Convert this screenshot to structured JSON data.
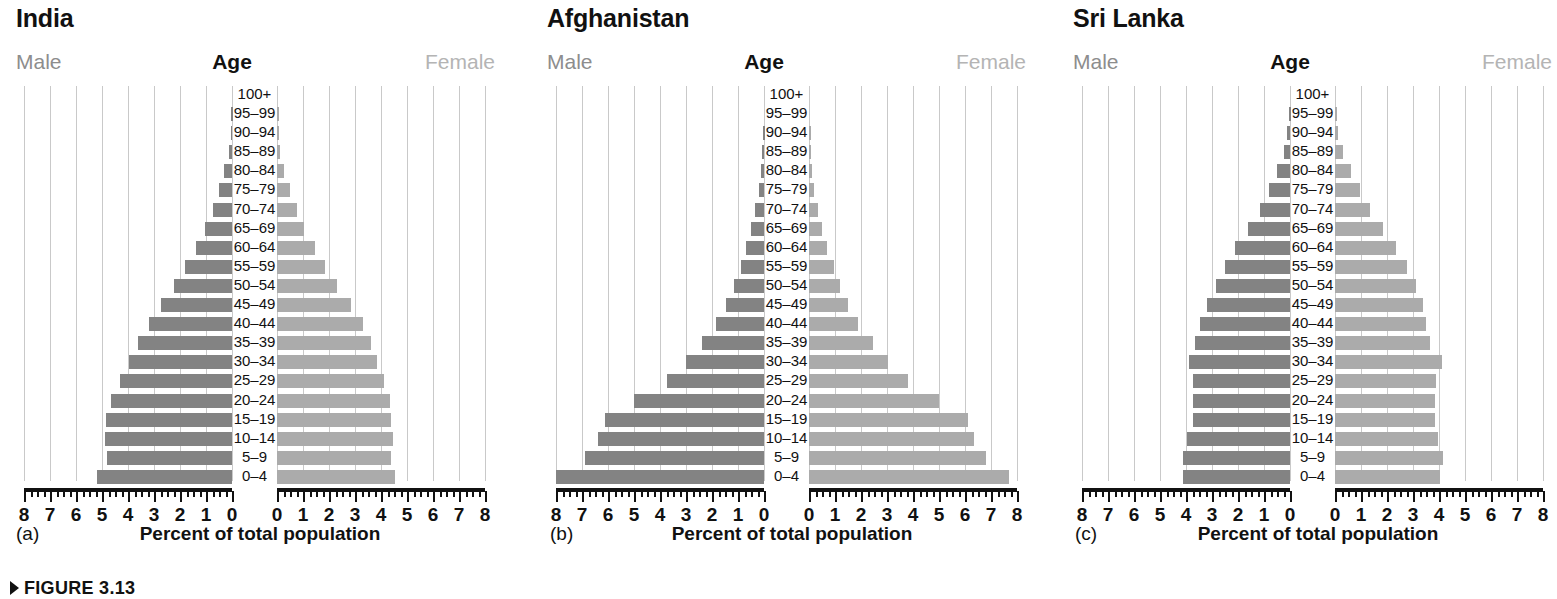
{
  "figure": {
    "caption": "FIGURE 3.13",
    "axis_caption": "Percent of total population",
    "male_label": "Male",
    "female_label": "Female",
    "age_label": "Age",
    "age_groups": [
      "100+",
      "95–99",
      "90–94",
      "85–89",
      "80–84",
      "75–79",
      "70–74",
      "65–69",
      "60–64",
      "55–59",
      "50–54",
      "45–49",
      "40–44",
      "35–39",
      "30–34",
      "25–29",
      "20–24",
      "15–19",
      "10–14",
      "5–9",
      "0–4"
    ],
    "tick_labels_left": [
      "8",
      "7",
      "6",
      "5",
      "4",
      "3",
      "2",
      "1",
      "0"
    ],
    "tick_labels_right": [
      "0",
      "1",
      "2",
      "3",
      "4",
      "5",
      "6",
      "7",
      "8"
    ],
    "colors": {
      "male_bar": "#838383",
      "female_bar": "#ababab",
      "gridline": "#c9c9c9",
      "axis": "#111111",
      "male_header_text": "#8d8d8d",
      "female_header_text": "#b4b4b4"
    }
  },
  "chart_data": [
    {
      "type": "bar",
      "title": "India",
      "panel_letter": "(a)",
      "xlabel": "Percent of total population",
      "ylabel": "Age",
      "xlim": [
        0,
        8
      ],
      "grid": true,
      "legend_position": "top-left-right",
      "categories": [
        "100+",
        "95–99",
        "90–94",
        "85–89",
        "80–84",
        "75–79",
        "70–74",
        "65–69",
        "60–64",
        "55–59",
        "50–54",
        "45–49",
        "40–44",
        "35–39",
        "30–34",
        "25–29",
        "20–24",
        "15–19",
        "10–14",
        "5–9",
        "0–4"
      ],
      "series": [
        {
          "name": "Male",
          "values": [
            0.0,
            0.02,
            0.05,
            0.12,
            0.3,
            0.5,
            0.75,
            1.05,
            1.4,
            1.8,
            2.25,
            2.75,
            3.2,
            3.6,
            3.95,
            4.3,
            4.65,
            4.85,
            4.9,
            4.8,
            5.2
          ]
        },
        {
          "name": "Female",
          "values": [
            0.0,
            0.02,
            0.05,
            0.12,
            0.28,
            0.5,
            0.75,
            1.05,
            1.45,
            1.85,
            2.3,
            2.85,
            3.3,
            3.6,
            3.85,
            4.1,
            4.35,
            4.4,
            4.45,
            4.4,
            4.55
          ]
        }
      ]
    },
    {
      "type": "bar",
      "title": "Afghanistan",
      "panel_letter": "(b)",
      "xlabel": "Percent of total population",
      "ylabel": "Age",
      "xlim": [
        0,
        8
      ],
      "grid": true,
      "legend_position": "top-left-right",
      "categories": [
        "100+",
        "95–99",
        "90–94",
        "85–89",
        "80–84",
        "75–79",
        "70–74",
        "65–69",
        "60–64",
        "55–59",
        "50–54",
        "45–49",
        "40–44",
        "35–39",
        "30–34",
        "25–29",
        "20–24",
        "15–19",
        "10–14",
        "5–9",
        "0–4"
      ],
      "series": [
        {
          "name": "Male",
          "values": [
            0.0,
            0.0,
            0.02,
            0.06,
            0.1,
            0.2,
            0.35,
            0.5,
            0.7,
            0.9,
            1.15,
            1.45,
            1.85,
            2.4,
            3.0,
            3.75,
            5.0,
            6.1,
            6.4,
            6.9,
            8.0
          ]
        },
        {
          "name": "Female",
          "values": [
            0.0,
            0.0,
            0.02,
            0.06,
            0.1,
            0.2,
            0.35,
            0.5,
            0.7,
            0.95,
            1.2,
            1.5,
            1.9,
            2.45,
            3.05,
            3.8,
            5.0,
            6.1,
            6.35,
            6.8,
            7.7
          ]
        }
      ]
    },
    {
      "type": "bar",
      "title": "Sri Lanka",
      "panel_letter": "(c)",
      "xlabel": "Percent of total population",
      "ylabel": "Age",
      "xlim": [
        0,
        8
      ],
      "grid": true,
      "legend_position": "top-left-right",
      "categories": [
        "100+",
        "95–99",
        "90–94",
        "85–89",
        "80–84",
        "75–79",
        "70–74",
        "65–69",
        "60–64",
        "55–59",
        "50–54",
        "45–49",
        "40–44",
        "35–39",
        "30–34",
        "25–29",
        "20–24",
        "15–19",
        "10–14",
        "5–9",
        "0–4"
      ],
      "series": [
        {
          "name": "Male",
          "values": [
            0.0,
            0.03,
            0.1,
            0.25,
            0.5,
            0.8,
            1.15,
            1.6,
            2.1,
            2.5,
            2.85,
            3.2,
            3.45,
            3.65,
            3.9,
            3.75,
            3.75,
            3.75,
            3.95,
            4.1,
            4.1
          ]
        },
        {
          "name": "Female",
          "values": [
            0.0,
            0.03,
            0.12,
            0.3,
            0.6,
            0.95,
            1.35,
            1.85,
            2.35,
            2.75,
            3.1,
            3.4,
            3.5,
            3.65,
            4.1,
            3.9,
            3.85,
            3.85,
            3.95,
            4.15,
            4.05
          ]
        }
      ]
    }
  ]
}
